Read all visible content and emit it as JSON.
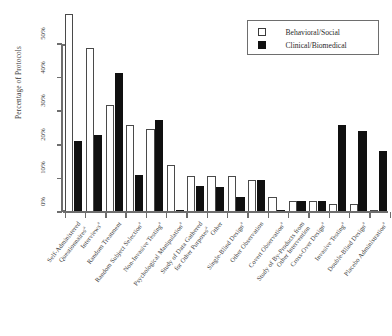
{
  "chart_data": {
    "type": "bar",
    "title": "",
    "subtitle": "",
    "xlabel": "",
    "ylabel": "Percentage of Protocols",
    "ylim": [
      0,
      60
    ],
    "ytick_values": [
      0,
      10,
      20,
      30,
      40,
      50
    ],
    "ytick_labels": [
      "0%",
      "10%",
      "20%",
      "30%",
      "40%",
      "50%"
    ],
    "grid": false,
    "legend_position": "top-right",
    "categories": [
      "Self-Administered Questionnaires",
      "Interviews",
      "Random Treatment",
      "Random Subject Selection",
      "Non-Invasive Testing",
      "Psychological Manipulation",
      "Study of Data Gathered for Other Purposes",
      "Other",
      "Single-Blind Design",
      "Other Observation",
      "Covert Observation",
      "Study of By-Products from Other Intervention",
      "Cross-Over Design",
      "Invasive Testing",
      "Double-Blind Design",
      "Placebo Administration"
    ],
    "category_lines": [
      [
        "Self-Administered",
        "Questionnaires"
      ],
      [
        "Interviews",
        ""
      ],
      [
        "Random Treatment",
        ""
      ],
      [
        "Random Subject Selection",
        ""
      ],
      [
        "Non-Invasive Testing",
        ""
      ],
      [
        "Psychological Manipulation",
        ""
      ],
      [
        "Study of Data Gathered",
        "for Other Purposes"
      ],
      [
        "Other",
        ""
      ],
      [
        "Single-Blind Design",
        ""
      ],
      [
        "Other Observation",
        ""
      ],
      [
        "Covert Observation",
        ""
      ],
      [
        "Study of By-Products from",
        "Other Intervention"
      ],
      [
        "Cross-Over Design",
        ""
      ],
      [
        "Invasive Testing",
        ""
      ],
      [
        "Double-Blind Design",
        ""
      ],
      [
        "Placebo Administration",
        ""
      ]
    ],
    "category_markers": [
      "a",
      "a",
      "",
      "a",
      "a",
      "a",
      "a",
      "",
      "a",
      "",
      "a",
      "",
      "a",
      "a",
      "a",
      "a"
    ],
    "series": [
      {
        "name": "Behavioral/Social",
        "color": "#ffffff",
        "values": [
          59.0,
          48.8,
          31.8,
          25.9,
          24.6,
          14.0,
          10.6,
          10.6,
          10.6,
          9.5,
          4.4,
          3.3,
          3.3,
          2.5,
          2.5,
          0.7
        ]
      },
      {
        "name": "Clinical/Biomedical",
        "color": "#101010",
        "values": [
          21.0,
          22.9,
          41.5,
          11.0,
          27.5,
          0.7,
          7.6,
          7.5,
          4.5,
          9.5,
          0.7,
          3.3,
          3.3,
          26.0,
          24.0,
          18.2
        ]
      }
    ]
  },
  "legend": {
    "entries": [
      {
        "label": "Behavioral/Social",
        "swatch": "open-square"
      },
      {
        "label": "Clinical/Biomedical",
        "swatch": "filled-square"
      }
    ]
  },
  "axes": {
    "y_title": "Percentage of Protocols"
  }
}
